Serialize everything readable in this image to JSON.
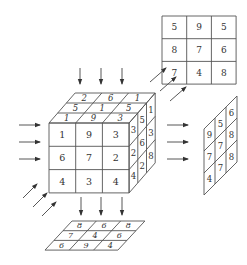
{
  "colors": {
    "line": "#555555",
    "text": "#333333",
    "arrow": "#444444",
    "background": "#ffffff"
  },
  "cube": {
    "front": [
      [
        "1",
        "9",
        "3"
      ],
      [
        "6",
        "7",
        "2"
      ],
      [
        "4",
        "3",
        "4"
      ]
    ],
    "top": [
      [
        "2",
        "6",
        "1"
      ],
      [
        "5",
        "1",
        "5"
      ],
      [
        "1",
        "9",
        "3"
      ]
    ],
    "right": [
      [
        "3",
        "5",
        "1"
      ],
      [
        "2",
        "6",
        "3"
      ],
      [
        "4",
        "2",
        "8"
      ]
    ]
  },
  "projection_top_right": {
    "grid": [
      [
        "5",
        "9",
        "5"
      ],
      [
        "8",
        "7",
        "6"
      ],
      [
        "7",
        "4",
        "8"
      ]
    ]
  },
  "projection_right": {
    "grid": [
      [
        "9",
        "5",
        "6"
      ],
      [
        "7",
        "7",
        "8"
      ],
      [
        "4",
        "7",
        "8"
      ]
    ]
  },
  "projection_bottom": {
    "grid": [
      [
        "8",
        "6",
        "8"
      ],
      [
        "7",
        "4",
        "6"
      ],
      [
        "6",
        "9",
        "4"
      ]
    ]
  },
  "arrows": {
    "top": 3,
    "left": 3,
    "bottom_left_diagonal": 3,
    "bottom": 3,
    "right": 3,
    "to_top_right_diagonal": 3
  }
}
